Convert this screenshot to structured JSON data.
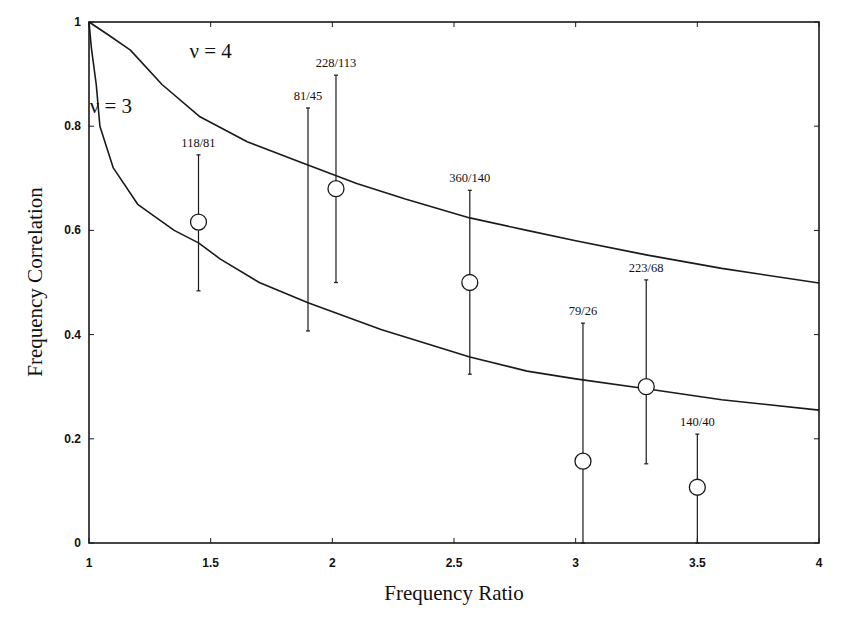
{
  "chart_data": {
    "type": "scatter",
    "title": "",
    "xlabel": "Frequency Ratio",
    "ylabel": "Frequency Correlation",
    "xlim": [
      1,
      4
    ],
    "ylim": [
      0,
      1
    ],
    "xticks": [
      1,
      1.5,
      2,
      2.5,
      3,
      3.5,
      4
    ],
    "xtick_labels": [
      "1",
      "1.5",
      "2",
      "2.5",
      "3",
      "3.5",
      "4"
    ],
    "yticks": [
      0,
      0.2,
      0.4,
      0.6,
      0.8,
      1
    ],
    "ytick_labels": [
      "0",
      "0.2",
      "0.4",
      "0.6",
      "0.8",
      "1"
    ],
    "grid": false,
    "legend": null,
    "curves": [
      {
        "name": "ν = 4",
        "label": "ν = 4",
        "label_pos": [
          1.5,
          0.93
        ],
        "points": [
          [
            1.0,
            1.0
          ],
          [
            1.08,
            0.975
          ],
          [
            1.17,
            0.946
          ],
          [
            1.3,
            0.88
          ],
          [
            1.456,
            0.818
          ],
          [
            1.65,
            0.77
          ],
          [
            1.867,
            0.731
          ],
          [
            2.1,
            0.69
          ],
          [
            2.3,
            0.66
          ],
          [
            2.565,
            0.624
          ],
          [
            2.8,
            0.6
          ],
          [
            3.0,
            0.58
          ],
          [
            3.29,
            0.553
          ],
          [
            3.6,
            0.527
          ],
          [
            4.0,
            0.499
          ]
        ]
      },
      {
        "name": "ν = 3",
        "label": "ν = 3",
        "label_pos": [
          1.09,
          0.825
        ],
        "points": [
          [
            1.0,
            1.0
          ],
          [
            1.01,
            0.95
          ],
          [
            1.03,
            0.879
          ],
          [
            1.045,
            0.8
          ],
          [
            1.1,
            0.72
          ],
          [
            1.2,
            0.65
          ],
          [
            1.35,
            0.6
          ],
          [
            1.45,
            0.576
          ],
          [
            1.54,
            0.545
          ],
          [
            1.7,
            0.5
          ],
          [
            1.9,
            0.461
          ],
          [
            2.2,
            0.41
          ],
          [
            2.565,
            0.357
          ],
          [
            2.8,
            0.33
          ],
          [
            3.0,
            0.315
          ],
          [
            3.29,
            0.296
          ],
          [
            3.6,
            0.275
          ],
          [
            4.0,
            0.255
          ]
        ]
      }
    ],
    "points": [
      {
        "label": "118/81",
        "x": 1.45,
        "y": 0.616,
        "err_low": 0.484,
        "err_high": 0.745,
        "marker": true
      },
      {
        "label": "81/45",
        "x": 1.9,
        "y": null,
        "err_low": 0.407,
        "err_high": 0.835,
        "marker": false
      },
      {
        "label": "228/113",
        "x": 2.015,
        "y": 0.68,
        "err_low": 0.5,
        "err_high": 0.898,
        "marker": true
      },
      {
        "label": "360/140",
        "x": 2.565,
        "y": 0.5,
        "err_low": 0.324,
        "err_high": 0.677,
        "marker": true
      },
      {
        "label": "79/26",
        "x": 3.03,
        "y": 0.157,
        "err_low": 0.0,
        "err_high": 0.422,
        "marker": true
      },
      {
        "label": "223/68",
        "x": 3.29,
        "y": 0.3,
        "err_low": 0.152,
        "err_high": 0.505,
        "marker": true
      },
      {
        "label": "140/40",
        "x": 3.5,
        "y": 0.107,
        "err_low": 0.0,
        "err_high": 0.209,
        "marker": true
      }
    ]
  },
  "style": {
    "line_color": "#1a1a1a",
    "marker_fill": "#ffffff",
    "background": "#ffffff"
  }
}
